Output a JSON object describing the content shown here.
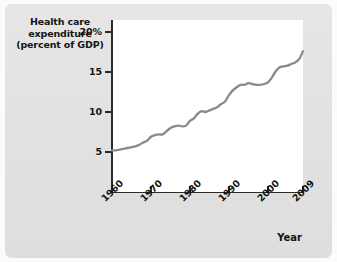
{
  "figure": {
    "background_color": "#e3e3e3",
    "plot_background_color": "#ffffff",
    "axis_color": "#2b2b2b",
    "line_color": "#8a8a8a"
  },
  "y_axis_title": {
    "line1": "Health care",
    "line2": "expenditure",
    "line3": "(percent of GDP)"
  },
  "x_axis_title": "Year",
  "chart_data": {
    "type": "line",
    "title": "Health care expenditure (percent of GDP)",
    "xlabel": "Year",
    "ylabel": "Health care expenditure (percent of GDP)",
    "xlim": [
      1960,
      2009
    ],
    "ylim": [
      0,
      21.5
    ],
    "grid": false,
    "legend": "none",
    "xticks": [
      1960,
      1970,
      1980,
      1990,
      2000,
      2009
    ],
    "xtick_labels": [
      "1960",
      "1970",
      "1980",
      "1990",
      "2000",
      "2009"
    ],
    "yticks": [
      5,
      10,
      15,
      20
    ],
    "ytick_labels": [
      "5",
      "10",
      "15",
      "20%"
    ],
    "series": [
      {
        "name": "Health care expenditure (percent of GDP)",
        "color": "#8a8a8a",
        "x": [
          1960,
          1961,
          1962,
          1963,
          1964,
          1965,
          1966,
          1967,
          1968,
          1969,
          1970,
          1971,
          1972,
          1973,
          1974,
          1975,
          1976,
          1977,
          1978,
          1979,
          1980,
          1981,
          1982,
          1983,
          1984,
          1985,
          1986,
          1987,
          1988,
          1989,
          1990,
          1991,
          1992,
          1993,
          1994,
          1995,
          1996,
          1997,
          1998,
          1999,
          2000,
          2001,
          2002,
          2003,
          2004,
          2005,
          2006,
          2007,
          2008,
          2009
        ],
        "values": [
          5.2,
          5.2,
          5.3,
          5.4,
          5.5,
          5.6,
          5.7,
          5.9,
          6.2,
          6.4,
          6.9,
          7.1,
          7.2,
          7.2,
          7.6,
          8.0,
          8.2,
          8.3,
          8.2,
          8.3,
          8.9,
          9.2,
          9.8,
          10.1,
          10.0,
          10.2,
          10.4,
          10.6,
          11.0,
          11.3,
          12.1,
          12.7,
          13.1,
          13.4,
          13.4,
          13.6,
          13.5,
          13.4,
          13.4,
          13.5,
          13.7,
          14.3,
          15.1,
          15.6,
          15.7,
          15.8,
          16.0,
          16.2,
          16.6,
          17.6
        ]
      }
    ]
  }
}
